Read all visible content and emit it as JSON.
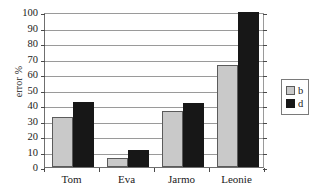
{
  "chart_data": {
    "type": "bar",
    "title": "",
    "xlabel": "",
    "ylabel": "error %",
    "categories": [
      "Tom",
      "Eva",
      "Jarmo",
      "Leonie"
    ],
    "series": [
      {
        "name": "b",
        "color": "#c9c9c9",
        "values": [
          32,
          6,
          36,
          66
        ]
      },
      {
        "name": "d",
        "color": "#171717",
        "values": [
          42,
          11,
          41,
          100
        ]
      }
    ],
    "ylim": [
      0,
      100
    ],
    "ytick_step": 10,
    "ytick_labels": [
      "0",
      "10",
      "20",
      "30",
      "40",
      "50",
      "60",
      "70",
      "80",
      "90",
      "100"
    ],
    "grid": true,
    "grid_axis": "y",
    "legend_position": "right-outside",
    "legend_entries": [
      {
        "label": "b",
        "color": "#c9c9c9"
      },
      {
        "label": "d",
        "color": "#171717"
      }
    ]
  },
  "colors": {
    "series_b": "#c9c9c9",
    "series_d": "#171717",
    "gridline": "#9a9a9a",
    "axis": "#4a4a4a",
    "background": "#ffffff",
    "text": "#1a1a1a"
  }
}
